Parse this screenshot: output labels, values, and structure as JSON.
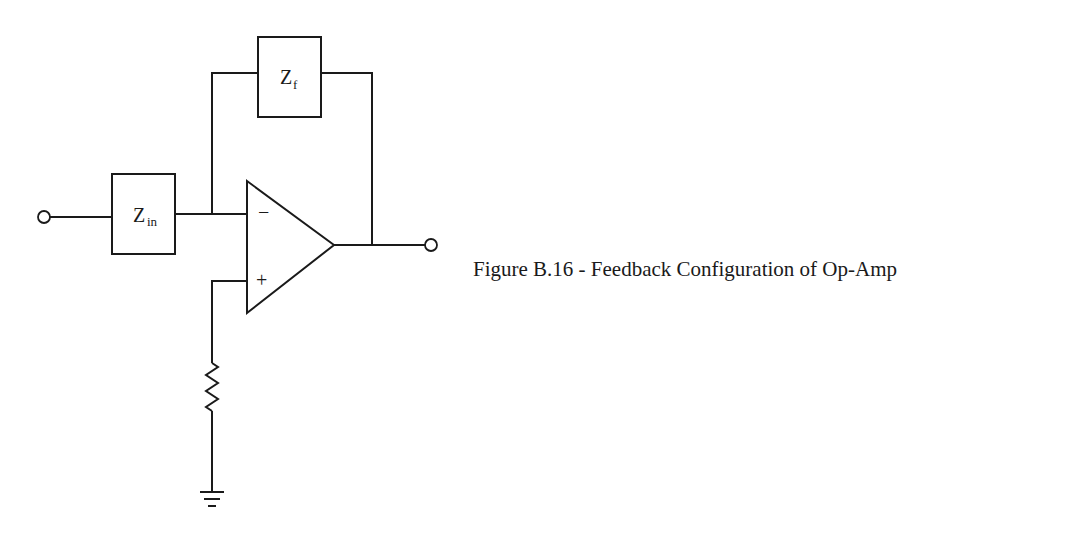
{
  "figure": {
    "caption": "Figure B.16 - Feedback Configuration of Op-Amp",
    "components": {
      "input_impedance": {
        "symbol": "Z",
        "subscript": "in"
      },
      "feedback_impedance": {
        "symbol": "Z",
        "subscript": "f"
      },
      "inverting_input_sign": "−",
      "noninverting_input_sign": "+"
    }
  }
}
